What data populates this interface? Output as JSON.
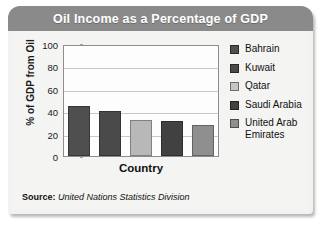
{
  "card": {
    "title": "Oil Income as a Percentage of GDP",
    "source_label": "Source:",
    "source_value": "United Nations Statistics Division"
  },
  "chart_data": {
    "type": "bar",
    "title": "Oil Income as a Percentage of GDP",
    "xlabel": "Country",
    "ylabel": "% of GDP from Oil",
    "categories": [
      "Bahrain",
      "Kuwait",
      "Qatar",
      "Saudi Arabia",
      "United Arab Emirates"
    ],
    "values": [
      45,
      40,
      32,
      31,
      28
    ],
    "ylim": [
      0,
      100
    ],
    "yticks": [
      100,
      80,
      60,
      40,
      20,
      0
    ],
    "grid": true,
    "legend_position": "right",
    "bar_colors": [
      "#4f4f4f",
      "#4a4a4a",
      "#b8b8b8",
      "#414141",
      "#8f8f8f"
    ],
    "legend": [
      {
        "label": "Bahrain",
        "color": "#4f4f4f"
      },
      {
        "label": "Kuwait",
        "color": "#4a4a4a"
      },
      {
        "label": "Qatar",
        "color": "#c6c6c6"
      },
      {
        "label": "Saudi Arabia",
        "color": "#414141"
      },
      {
        "label": "United Arab Emirates",
        "color": "#8f8f8f"
      }
    ]
  },
  "colors": {
    "title_band": "#8a8a8a",
    "card_bg": "#f2f2f0",
    "plot_bg": "#fdfdfd",
    "gridline": "#c9c9c9",
    "axis": "#8d8d8d"
  }
}
